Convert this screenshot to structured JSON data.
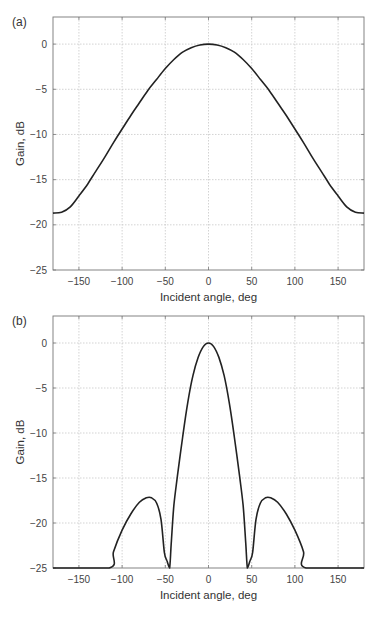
{
  "chart_data": [
    {
      "panel": "(a)",
      "type": "line",
      "title": "",
      "xlabel": "Incident angle, deg",
      "ylabel": "Gain, dB",
      "xlim": [
        -180,
        180
      ],
      "ylim": [
        -25,
        3
      ],
      "xticks": [
        -150,
        -100,
        -50,
        0,
        50,
        100,
        150
      ],
      "yticks": [
        0,
        -5,
        -10,
        -15,
        -20,
        -25
      ],
      "grid": true,
      "legend": null,
      "series": [
        {
          "name": "gain",
          "x": [
            -180,
            -170,
            -160,
            -150,
            -140,
            -130,
            -120,
            -110,
            -100,
            -90,
            -80,
            -70,
            -60,
            -50,
            -40,
            -30,
            -20,
            -10,
            0,
            10,
            20,
            30,
            40,
            50,
            60,
            70,
            80,
            90,
            100,
            110,
            120,
            130,
            140,
            150,
            160,
            170,
            180
          ],
          "y": [
            -18.7,
            -18.6,
            -18.0,
            -16.8,
            -15.5,
            -14.0,
            -12.5,
            -10.9,
            -9.4,
            -7.9,
            -6.5,
            -5.1,
            -3.9,
            -2.7,
            -1.7,
            -0.9,
            -0.4,
            -0.1,
            0.0,
            -0.1,
            -0.4,
            -0.9,
            -1.7,
            -2.7,
            -3.9,
            -5.1,
            -6.5,
            -7.9,
            -9.4,
            -10.9,
            -12.5,
            -14.0,
            -15.5,
            -16.8,
            -18.0,
            -18.6,
            -18.7
          ]
        }
      ]
    },
    {
      "panel": "(b)",
      "type": "line",
      "title": "",
      "xlabel": "Incident angle, deg",
      "ylabel": "Gain, dB",
      "xlim": [
        -180,
        180
      ],
      "ylim": [
        -25,
        3
      ],
      "xticks": [
        -150,
        -100,
        -50,
        0,
        50,
        100,
        150
      ],
      "yticks": [
        0,
        -5,
        -10,
        -15,
        -20,
        -25
      ],
      "grid": true,
      "legend": null,
      "series": [
        {
          "name": "gain",
          "x": [
            -180,
            -115,
            -110,
            -100,
            -90,
            -80,
            -72,
            -66,
            -60,
            -55,
            -51,
            -48,
            -45,
            -43,
            -40,
            -36,
            -30,
            -24,
            -18,
            -12,
            -6,
            0,
            6,
            12,
            18,
            24,
            30,
            36,
            40,
            43,
            45,
            48,
            51,
            55,
            60,
            66,
            72,
            80,
            90,
            100,
            110,
            113,
            180
          ],
          "y": [
            -25,
            -25,
            -23.2,
            -20.8,
            -19.0,
            -17.7,
            -17.2,
            -17.2,
            -17.8,
            -19.6,
            -23.3,
            -24.2,
            -25,
            -22.0,
            -18.0,
            -14.8,
            -10.5,
            -6.6,
            -3.6,
            -1.6,
            -0.4,
            0.0,
            -0.4,
            -1.6,
            -3.6,
            -6.6,
            -10.5,
            -14.8,
            -18.0,
            -22.0,
            -25,
            -24.2,
            -23.3,
            -19.6,
            -17.8,
            -17.2,
            -17.2,
            -17.7,
            -19.0,
            -20.8,
            -23.2,
            -25,
            -25
          ]
        }
      ]
    }
  ],
  "panels": [
    {
      "label": "(a)",
      "ylabel": "Gain, dB",
      "xlabel": "Incident angle, deg"
    },
    {
      "label": "(b)",
      "ylabel": "Gain, dB",
      "xlabel": "Incident angle, deg"
    }
  ]
}
